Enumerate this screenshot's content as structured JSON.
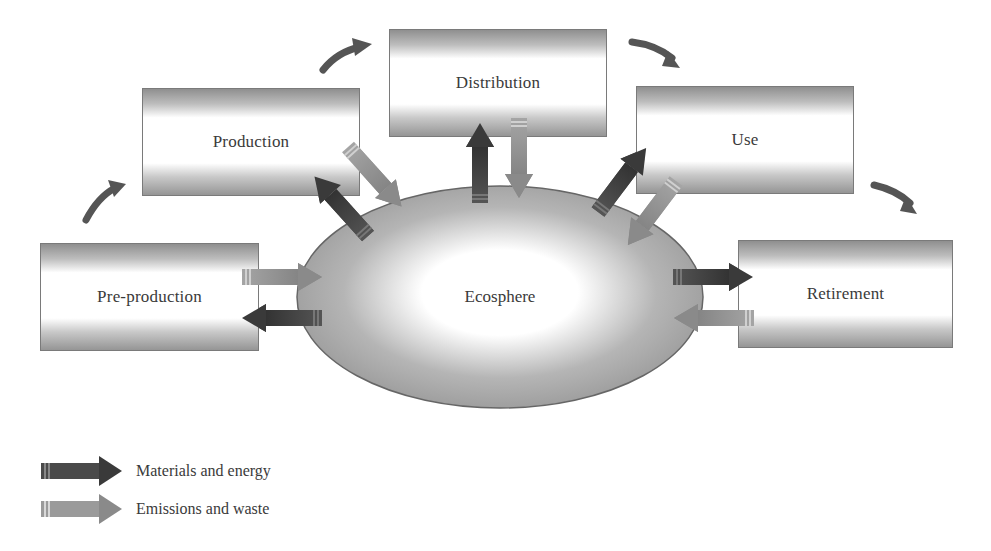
{
  "diagram": {
    "title": "",
    "stages": [
      {
        "id": "pre-production",
        "label": "Pre-production"
      },
      {
        "id": "production",
        "label": "Production"
      },
      {
        "id": "distribution",
        "label": "Distribution"
      },
      {
        "id": "use",
        "label": "Use"
      },
      {
        "id": "retirement",
        "label": "Retirement"
      }
    ],
    "center": {
      "label": "Ecosphere"
    },
    "flow_order": [
      "Pre-production",
      "Production",
      "Distribution",
      "Use",
      "Retirement"
    ],
    "legend": [
      {
        "label": "Materials and energy",
        "arrow": "dark-arrow-icon",
        "color": "#3d3d3d"
      },
      {
        "label": "Emissions and waste",
        "arrow": "light-arrow-icon",
        "color": "#8a8a8a"
      }
    ],
    "colors": {
      "materials_energy": "#3d3d3d",
      "emissions_waste": "#8a8a8a",
      "cycle_arrow": "#555555",
      "box_border": "#7a7a7a"
    }
  }
}
